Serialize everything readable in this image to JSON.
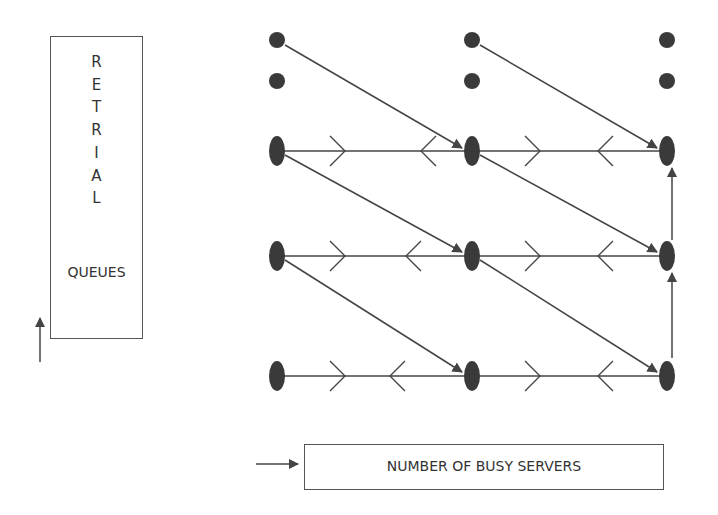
{
  "retrial_box": {
    "letters": [
      "R",
      "E",
      "T",
      "R",
      "I",
      "A",
      "L"
    ],
    "label": "QUEUES"
  },
  "servers_box": {
    "label": "NUMBER OF BUSY SERVERS"
  },
  "diagram": {
    "columns_x": [
      277,
      472,
      667
    ],
    "rows_y": [
      40,
      81,
      151,
      256,
      376
    ],
    "node_color": "#3a3a3a",
    "edge_color": "#444444"
  }
}
